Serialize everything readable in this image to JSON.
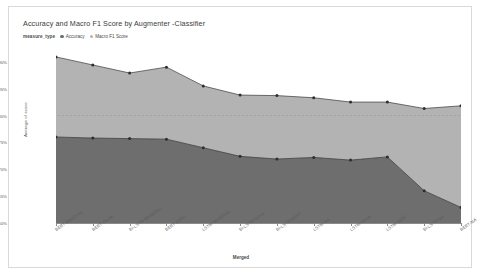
{
  "chart_data": {
    "type": "area",
    "title": "Accuracy and Macro F1 Score by Augmenter -Classifier",
    "xlabel": "Merged",
    "ylabel": "Average of score",
    "stacked": true,
    "grid": false,
    "legend_position": "top-left",
    "legend_title": "measure_type",
    "ylim": [
      60,
      92
    ],
    "yticks": [
      90,
      85,
      80,
      75,
      70,
      65,
      60
    ],
    "ytick_labels": [
      "90%",
      "85%",
      "80%",
      "75%",
      "70%",
      "65%",
      "60%"
    ],
    "reference_line": 80,
    "categories": [
      "BERT-Word2Vec",
      "BERT-GloVe",
      "Bi-LSTM-Word2Vec",
      "BERT-BERT",
      "LSTM-Word2Vec",
      "Bi-LSTM-GloVe",
      "Bi-LSTM-BERT",
      "LSTM-NA",
      "LSTM-GloVe",
      "LSTM-BERT",
      "Bi-LSTM-NA",
      "BERT-NA"
    ],
    "series": [
      {
        "name": "Accuracy",
        "color": "#6e6e6e",
        "values": [
          76.0,
          75.8,
          75.7,
          75.6,
          74.0,
          72.4,
          71.9,
          72.2,
          71.7,
          72.3,
          66.0,
          62.9
        ]
      },
      {
        "name": "Macro F1 Score",
        "color": "#b3b3b3",
        "values": [
          14.9,
          13.6,
          12.2,
          13.4,
          11.5,
          11.4,
          11.8,
          11.1,
          10.8,
          10.2,
          15.3,
          18.9
        ]
      }
    ],
    "stack_totals": [
      90.9,
      89.4,
      87.9,
      89.0,
      85.5,
      83.8,
      83.7,
      83.3,
      82.5,
      82.5,
      81.3,
      81.8
    ]
  },
  "colors": {
    "accuracy": "#6e6e6e",
    "macro_f1": "#b3b3b3",
    "axis": "#8a8a8a",
    "panel_border": "#d9d9d9",
    "reference_line": "#9a9a9a",
    "text": "#5a5a5a"
  }
}
